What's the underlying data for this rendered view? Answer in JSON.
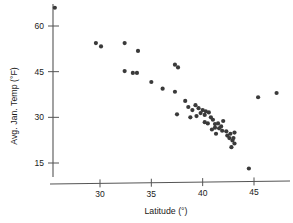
{
  "chart_data": {
    "type": "scatter",
    "title": "",
    "xlabel": "Latitude (°)",
    "ylabel": "Avg. Jan. Temp (°F)",
    "xlim": [
      25.5,
      47.8
    ],
    "ylim": [
      10.0,
      68.0
    ],
    "xticks": [
      30,
      35,
      40,
      45
    ],
    "yticks": [
      15,
      30,
      45,
      60
    ],
    "xtick_labels": [
      "30",
      "35",
      "40",
      "45"
    ],
    "ytick_labels": [
      "15",
      "30",
      "45",
      "60"
    ],
    "grid": false,
    "legend": null,
    "marker": {
      "shape": "circle",
      "color": "#3a3a3a",
      "radius_px": 2.1
    },
    "series": [
      {
        "name": "US cities",
        "points": [
          [
            25.6,
            66.0
          ],
          [
            29.6,
            54.4
          ],
          [
            30.1,
            53.3
          ],
          [
            32.4,
            54.4
          ],
          [
            33.7,
            51.8
          ],
          [
            32.4,
            45.2
          ],
          [
            33.2,
            44.6
          ],
          [
            33.6,
            44.6
          ],
          [
            35.0,
            41.6
          ],
          [
            36.1,
            39.4
          ],
          [
            37.3,
            47.3
          ],
          [
            37.6,
            46.4
          ],
          [
            37.3,
            38.4
          ],
          [
            37.5,
            31.0
          ],
          [
            38.3,
            35.4
          ],
          [
            38.6,
            33.4
          ],
          [
            39.0,
            32.4
          ],
          [
            39.3,
            34.0
          ],
          [
            39.6,
            33.0
          ],
          [
            38.8,
            30.0
          ],
          [
            39.4,
            30.4
          ],
          [
            39.8,
            31.4
          ],
          [
            40.0,
            32.4
          ],
          [
            40.2,
            30.8
          ],
          [
            40.3,
            32.0
          ],
          [
            40.6,
            31.6
          ],
          [
            40.2,
            28.4
          ],
          [
            40.5,
            28.0
          ],
          [
            40.8,
            30.0
          ],
          [
            41.0,
            29.2
          ],
          [
            41.2,
            27.8
          ],
          [
            41.2,
            26.6
          ],
          [
            41.5,
            28.0
          ],
          [
            41.6,
            26.4
          ],
          [
            41.8,
            27.0
          ],
          [
            41.9,
            25.6
          ],
          [
            40.9,
            26.0
          ],
          [
            41.3,
            24.6
          ],
          [
            42.0,
            28.8
          ],
          [
            42.3,
            25.4
          ],
          [
            42.4,
            24.0
          ],
          [
            42.6,
            23.2
          ],
          [
            42.7,
            24.6
          ],
          [
            42.9,
            22.4
          ],
          [
            43.0,
            23.2
          ],
          [
            43.1,
            21.4
          ],
          [
            43.1,
            25.0
          ],
          [
            42.8,
            20.2
          ],
          [
            44.5,
            13.2
          ],
          [
            45.4,
            36.6
          ],
          [
            47.2,
            38.0
          ]
        ]
      }
    ]
  },
  "axes": {
    "x_axis_name": "latitude-axis",
    "y_axis_name": "temperature-axis"
  }
}
